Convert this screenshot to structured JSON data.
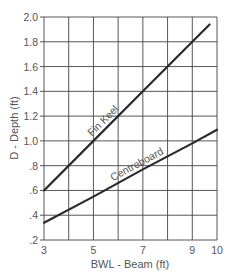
{
  "chart_data": {
    "type": "line",
    "title": "",
    "xlabel": "BWL - Beam (ft)",
    "ylabel": "D - Depth (ft)",
    "xlim": [
      3,
      10
    ],
    "ylim": [
      0.2,
      2.0
    ],
    "grid": true,
    "legend": "inline labels on lines",
    "x_ticks": [
      3,
      5,
      7,
      9,
      10
    ],
    "x_tick_labels": [
      "3",
      "5",
      "7",
      "9",
      "10"
    ],
    "x_gridlines": [
      3,
      4,
      5,
      6,
      7,
      8,
      9,
      10
    ],
    "y_ticks": [
      0.2,
      0.4,
      0.6,
      0.8,
      1.0,
      1.2,
      1.4,
      1.6,
      1.8,
      2.0
    ],
    "y_tick_labels": [
      ".2",
      ".4",
      ".6",
      ".8",
      "1.0",
      "1.2",
      "1.4",
      "1.6",
      "1.8",
      "2.0"
    ],
    "series": [
      {
        "name": "Fin Keel",
        "x": [
          3,
          5,
          7,
          9,
          9.7
        ],
        "values": [
          0.6,
          1.0,
          1.4,
          1.8,
          1.94
        ]
      },
      {
        "name": "Centreboard",
        "x": [
          3,
          5,
          7,
          9,
          10
        ],
        "values": [
          0.34,
          0.55,
          0.77,
          0.98,
          1.09
        ]
      }
    ]
  },
  "colors": {
    "line": "#2a2a2a",
    "grid": "#444444",
    "text": "#555555"
  }
}
